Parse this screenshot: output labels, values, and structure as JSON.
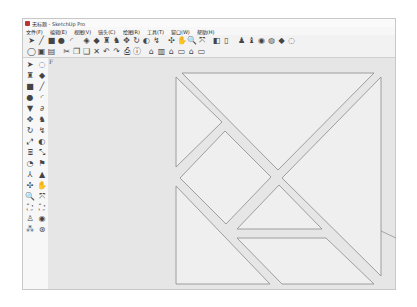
{
  "window": {
    "title": "无标题 - SketchUp Pro",
    "app_icon": "sketchup-icon"
  },
  "menubar": {
    "items": [
      "文件(F)",
      "编辑(E)",
      "视图(V)",
      "镜头(C)",
      "绘图(R)",
      "工具(T)",
      "窗口(W)",
      "帮助(H)"
    ]
  },
  "toolbar_top": {
    "icons": [
      {
        "name": "select-icon",
        "glyph": "➤"
      },
      {
        "name": "pencil-line-icon",
        "glyph": "╱"
      },
      {
        "name": "rectangle-icon",
        "glyph": "■"
      },
      {
        "name": "circle-icon",
        "glyph": "●"
      },
      {
        "name": "arc-icon",
        "glyph": "◜"
      },
      {
        "name": "sep",
        "glyph": ""
      },
      {
        "name": "make-component-icon",
        "glyph": "◈"
      },
      {
        "name": "eraser-icon",
        "glyph": "◆"
      },
      {
        "name": "paint-bucket-icon",
        "glyph": "♜"
      },
      {
        "name": "push-pull-icon",
        "glyph": "♞"
      },
      {
        "name": "move-icon",
        "glyph": "✥"
      },
      {
        "name": "rotate-icon",
        "glyph": "↻"
      },
      {
        "name": "offset-icon",
        "glyph": "◐"
      },
      {
        "name": "follow-me-icon",
        "glyph": "↯"
      },
      {
        "name": "sep",
        "glyph": ""
      },
      {
        "name": "orbit-icon",
        "glyph": "✣"
      },
      {
        "name": "pan-icon",
        "glyph": "✋"
      },
      {
        "name": "zoom-icon",
        "glyph": "🔍"
      },
      {
        "name": "zoom-extents-icon",
        "glyph": "⤧"
      },
      {
        "name": "sep",
        "glyph": ""
      },
      {
        "name": "previous-view-icon",
        "glyph": "◧"
      },
      {
        "name": "next-view-icon",
        "glyph": "▯"
      },
      {
        "name": "sep",
        "glyph": ""
      },
      {
        "name": "add-location-icon",
        "glyph": "♟"
      },
      {
        "name": "toggle-terrain-icon",
        "glyph": "♝"
      },
      {
        "name": "3d-warehouse-icon",
        "glyph": "◉"
      },
      {
        "name": "share-model-icon",
        "glyph": "◍"
      },
      {
        "name": "get-models-icon",
        "glyph": "◆"
      },
      {
        "name": "extension-warehouse-icon",
        "glyph": "◌"
      }
    ]
  },
  "toolbar_bottom": {
    "icons": [
      {
        "name": "new-icon",
        "glyph": "◯"
      },
      {
        "name": "open-icon",
        "glyph": "▣"
      },
      {
        "name": "save-icon",
        "glyph": "▤"
      },
      {
        "name": "sep",
        "glyph": ""
      },
      {
        "name": "cut-icon",
        "glyph": "✂"
      },
      {
        "name": "copy-icon",
        "glyph": "❐"
      },
      {
        "name": "paste-icon",
        "glyph": "❏"
      },
      {
        "name": "delete-icon",
        "glyph": "✕"
      },
      {
        "name": "undo-icon",
        "glyph": "↶"
      },
      {
        "name": "redo-icon",
        "glyph": "↷"
      },
      {
        "name": "print-icon",
        "glyph": "⎙"
      },
      {
        "name": "model-info-icon",
        "glyph": "ⓘ"
      },
      {
        "name": "sep",
        "glyph": ""
      },
      {
        "name": "iso-view-icon",
        "glyph": "⌂"
      },
      {
        "name": "top-view-icon",
        "glyph": "▥"
      },
      {
        "name": "front-view-icon",
        "glyph": "⌂"
      },
      {
        "name": "right-view-icon",
        "glyph": "▭"
      },
      {
        "name": "back-view-icon",
        "glyph": "⌂"
      },
      {
        "name": "left-view-icon",
        "glyph": "▭"
      }
    ]
  },
  "toolbar_left": {
    "icons": [
      {
        "name": "select-icon",
        "glyph": "➤"
      },
      {
        "name": "make-component-icon",
        "glyph": "◌"
      },
      {
        "name": "paint-bucket-icon",
        "glyph": "♜"
      },
      {
        "name": "eraser-icon",
        "glyph": "◆"
      },
      {
        "name": "rectangle-icon",
        "glyph": "■"
      },
      {
        "name": "line-icon",
        "glyph": "╱"
      },
      {
        "name": "circle-icon",
        "glyph": "●"
      },
      {
        "name": "arc-icon",
        "glyph": "◜"
      },
      {
        "name": "polygon-icon",
        "glyph": "▼"
      },
      {
        "name": "freehand-icon",
        "glyph": "∂"
      },
      {
        "name": "move-icon",
        "glyph": "✥"
      },
      {
        "name": "push-pull-icon",
        "glyph": "♞"
      },
      {
        "name": "rotate-icon",
        "glyph": "↻"
      },
      {
        "name": "follow-me-icon",
        "glyph": "↯"
      },
      {
        "name": "scale-icon",
        "glyph": "⤢"
      },
      {
        "name": "offset-icon",
        "glyph": "◐"
      },
      {
        "name": "tape-measure-icon",
        "glyph": "⌸"
      },
      {
        "name": "dimension-icon",
        "glyph": "⤡"
      },
      {
        "name": "protractor-icon",
        "glyph": "◔"
      },
      {
        "name": "text-icon",
        "glyph": "⚑"
      },
      {
        "name": "axes-icon",
        "glyph": "⅄"
      },
      {
        "name": "3d-text-icon",
        "glyph": "▲"
      },
      {
        "name": "orbit-icon",
        "glyph": "✣"
      },
      {
        "name": "pan-icon",
        "glyph": "✋"
      },
      {
        "name": "zoom-icon",
        "glyph": "🔍"
      },
      {
        "name": "zoom-window-icon",
        "glyph": "⤧"
      },
      {
        "name": "zoom-extents-icon",
        "glyph": "⛶"
      },
      {
        "name": "previous-view-icon",
        "glyph": "⛶"
      },
      {
        "name": "position-camera-icon",
        "glyph": "♙"
      },
      {
        "name": "look-around-icon",
        "glyph": "◉"
      },
      {
        "name": "walk-icon",
        "glyph": "⁂"
      },
      {
        "name": "section-plane-icon",
        "glyph": "⊛"
      }
    ]
  },
  "canvas": {
    "background": "#e6e6e6",
    "axis_label": "F",
    "piece_fill": "#efefef",
    "piece_stroke": "#8a8a8a",
    "pieces": [
      {
        "name": "top-large-triangle",
        "points": "182,73 374,73 278,170"
      },
      {
        "name": "left-small-triangle",
        "points": "176,77 176,167 222,122"
      },
      {
        "name": "square",
        "points": "225,131 271,177 226,224 180,178"
      },
      {
        "name": "right-large-triangle",
        "points": "381,77 381,276 282,178"
      },
      {
        "name": "middle-small-triangle",
        "points": "279,185 322,229 237,229"
      },
      {
        "name": "bottom-left-triangle",
        "points": "176,186 176,284 270,284"
      },
      {
        "name": "parallelogram",
        "points": "237,238 326,238 374,284 282,284"
      }
    ],
    "axis_line": {
      "x1": 381,
      "y1": 231,
      "x2": 396,
      "y2": 238
    }
  }
}
